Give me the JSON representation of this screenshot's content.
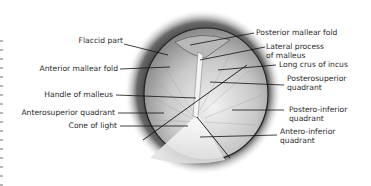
{
  "figure": {
    "labels_left": [
      {
        "id": "flaccid-part",
        "text": "Flaccid part"
      },
      {
        "id": "anterior-mallear-fold",
        "text": "Anterior mallear fold"
      },
      {
        "id": "handle-of-malleus",
        "text": "Handle of malleus"
      },
      {
        "id": "anterosuperior-quadrant",
        "text": "Anterosuperior quadrant"
      },
      {
        "id": "cone-of-light",
        "text": "Cone of light"
      }
    ],
    "labels_right": [
      {
        "id": "posterior-mallear-fold",
        "text": "Posterior mallear fold"
      },
      {
        "id": "lateral-process-of-malleus",
        "line1": "Lateral process",
        "line2": "of malleus"
      },
      {
        "id": "long-crus-of-incus",
        "text": "Long crus of incus"
      },
      {
        "id": "posterosuperior-quadrant",
        "line1": "Posterosuperior",
        "line2": "quadrant"
      },
      {
        "id": "postero-inferior-quadrant",
        "line1": "Postero-inferior",
        "line2": "quadrant"
      },
      {
        "id": "antero-inferior-quadrant",
        "line1": "Antero-inferior",
        "line2": "quadrant"
      }
    ]
  }
}
